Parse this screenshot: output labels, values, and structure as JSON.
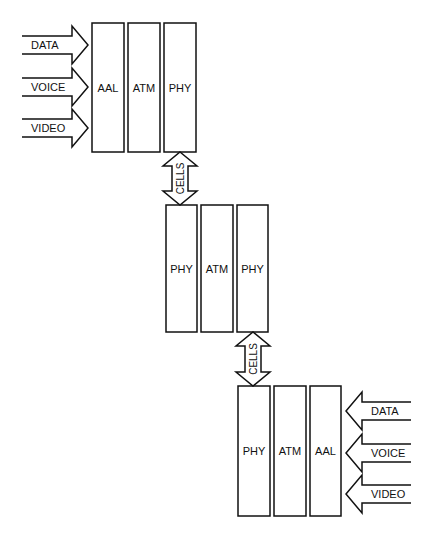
{
  "diagram": {
    "stacks": [
      {
        "name": "source-end-system",
        "layers": [
          {
            "label": "AAL",
            "x": 92,
            "y": 23,
            "w": 32,
            "h": 129
          },
          {
            "label": "ATM",
            "x": 128,
            "y": 23,
            "w": 32,
            "h": 129
          },
          {
            "label": "PHY",
            "x": 164,
            "y": 23,
            "w": 32,
            "h": 129
          }
        ]
      },
      {
        "name": "atm-switch",
        "layers": [
          {
            "label": "PHY",
            "x": 166,
            "y": 205,
            "w": 31,
            "h": 127
          },
          {
            "label": "ATM",
            "x": 201,
            "y": 205,
            "w": 32,
            "h": 127
          },
          {
            "label": "PHY",
            "x": 237,
            "y": 205,
            "w": 31,
            "h": 127
          }
        ]
      },
      {
        "name": "destination-end-system",
        "layers": [
          {
            "label": "PHY",
            "x": 238,
            "y": 386,
            "w": 32,
            "h": 130
          },
          {
            "label": "ATM",
            "x": 274,
            "y": 386,
            "w": 32,
            "h": 130
          },
          {
            "label": "AAL",
            "x": 310,
            "y": 386,
            "w": 31,
            "h": 130
          }
        ]
      }
    ],
    "inputs_left": [
      {
        "label": "DATA",
        "y": 45
      },
      {
        "label": "VOICE",
        "y": 87
      },
      {
        "label": "VIDEO",
        "y": 128
      }
    ],
    "inputs_right": [
      {
        "label": "DATA",
        "y": 411
      },
      {
        "label": "VOICE",
        "y": 453
      },
      {
        "label": "VIDEO",
        "y": 494
      }
    ],
    "cells_links": [
      {
        "label": "CELLS",
        "cx": 180,
        "top": 152,
        "bottom": 205
      },
      {
        "label": "CELLS",
        "cx": 253,
        "top": 332,
        "bottom": 386
      }
    ]
  }
}
